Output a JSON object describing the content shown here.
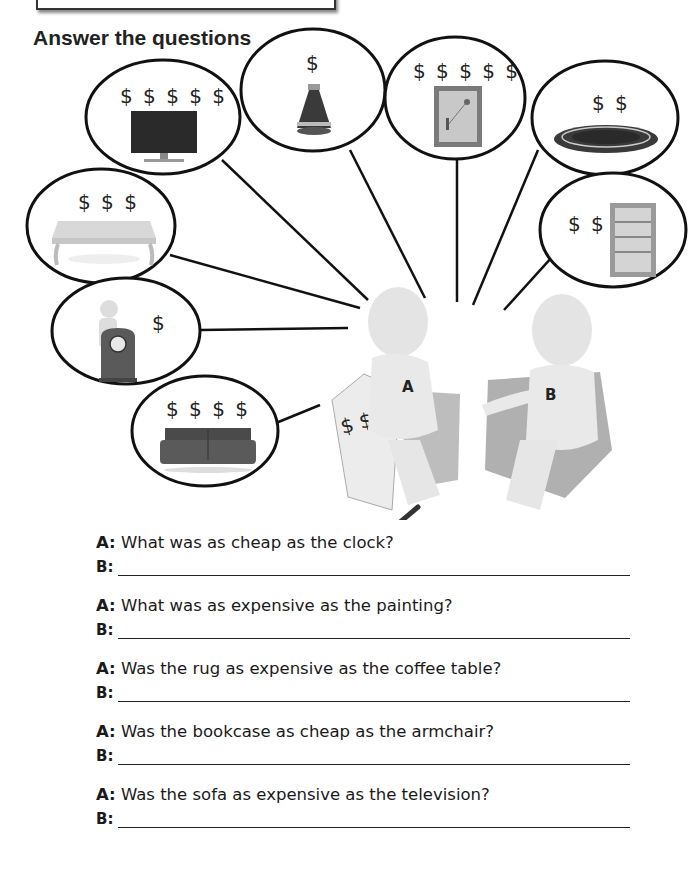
{
  "heading": "Answer the questions",
  "items": [
    {
      "name": "television",
      "price": "$ $ $ $ $"
    },
    {
      "name": "vase",
      "price": "$"
    },
    {
      "name": "painting",
      "price": "$ $ $ $ $"
    },
    {
      "name": "rug",
      "price": "$ $"
    },
    {
      "name": "coffee table",
      "price": "$ $ $"
    },
    {
      "name": "bookcase",
      "price": "$ $"
    },
    {
      "name": "clock",
      "price": "$"
    },
    {
      "name": "sofa",
      "price": "$ $ $ $"
    },
    {
      "name": "armchair",
      "price": "$ $"
    }
  ],
  "figures": {
    "a_label": "A",
    "b_label": "B"
  },
  "questions": [
    {
      "speaker_a": "A:",
      "question": "What was as cheap as the clock?",
      "speaker_b": "B:",
      "answer": ""
    },
    {
      "speaker_a": "A:",
      "question": "What was as expensive as the painting?",
      "speaker_b": "B:",
      "answer": ""
    },
    {
      "speaker_a": "A:",
      "question": "Was the rug as expensive as the coffee table?",
      "speaker_b": "B:",
      "answer": ""
    },
    {
      "speaker_a": "A:",
      "question": "Was the bookcase as cheap as the armchair?",
      "speaker_b": "B:",
      "answer": ""
    },
    {
      "speaker_a": "A:",
      "question": "Was the sofa as expensive as the television?",
      "speaker_b": "B:",
      "answer": ""
    }
  ]
}
